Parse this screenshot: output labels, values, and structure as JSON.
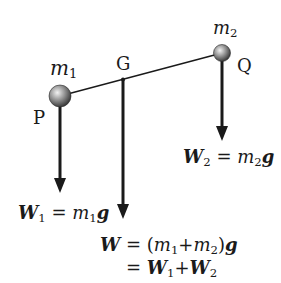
{
  "diagram": {
    "type": "center-of-gravity-two-masses",
    "points": {
      "P": {
        "label": "P",
        "mass_label": "m",
        "mass_sub": "1"
      },
      "G": {
        "label": "G"
      },
      "Q": {
        "label": "Q",
        "mass_label": "m",
        "mass_sub": "2"
      }
    },
    "forces": {
      "W1": {
        "sym": "W",
        "sub": "1",
        "eq": "=",
        "rhs_m": "m",
        "rhs_sub": "1",
        "rhs_g": "g"
      },
      "W2": {
        "sym": "W",
        "sub": "2",
        "eq": "=",
        "rhs_m": "m",
        "rhs_sub": "2",
        "rhs_g": "g"
      },
      "W": {
        "line1": {
          "sym": "W",
          "eq": "=",
          "open": "(",
          "m1": "m",
          "m1_sub": "1",
          "plus": "+",
          "m2": "m",
          "m2_sub": "2",
          "close": ")",
          "g": "g"
        },
        "line2": {
          "eq": "=",
          "a": "W",
          "a_sub": "1",
          "plus": "+",
          "b": "W",
          "b_sub": "2"
        }
      }
    },
    "colors": {
      "line": "#1a1a1a",
      "ball_light": "#f0f0f0",
      "ball_dark": "#3a3a3a"
    }
  }
}
